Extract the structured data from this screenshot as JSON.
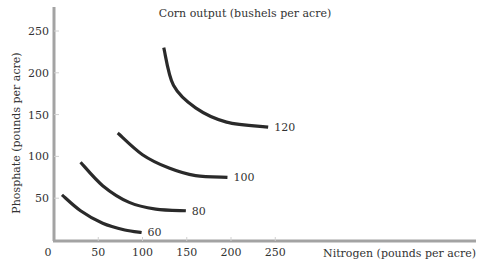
{
  "chart_data": {
    "type": "line",
    "title": "Corn output (bushels per acre)",
    "xlabel": "Nitrogen (pounds per acre)",
    "ylabel": "Phosphate (pounds per acre)",
    "xlim": [
      0,
      480
    ],
    "ylim": [
      0,
      280
    ],
    "x_ticks": [
      0,
      50,
      100,
      150,
      200,
      250
    ],
    "y_ticks": [
      50,
      100,
      150,
      200,
      250
    ],
    "grid": false,
    "legend": "inline labels at curve ends",
    "series": [
      {
        "name": "60",
        "label": "60",
        "points": [
          [
            9,
            54
          ],
          [
            30,
            35
          ],
          [
            55,
            20
          ],
          [
            80,
            12
          ],
          [
            99,
            9
          ]
        ]
      },
      {
        "name": "80",
        "label": "80",
        "points": [
          [
            30,
            93
          ],
          [
            55,
            65
          ],
          [
            85,
            45
          ],
          [
            115,
            37
          ],
          [
            149,
            35
          ]
        ]
      },
      {
        "name": "100",
        "label": "100",
        "points": [
          [
            72,
            128
          ],
          [
            100,
            102
          ],
          [
            130,
            86
          ],
          [
            160,
            77
          ],
          [
            196,
            75
          ]
        ]
      },
      {
        "name": "120",
        "label": "120",
        "points": [
          [
            124,
            230
          ],
          [
            135,
            185
          ],
          [
            160,
            158
          ],
          [
            195,
            141
          ],
          [
            242,
            135
          ]
        ]
      }
    ]
  },
  "colors": {
    "axis": "#a3a3a3",
    "curve": "#2a2a2a",
    "text": "#333333"
  }
}
